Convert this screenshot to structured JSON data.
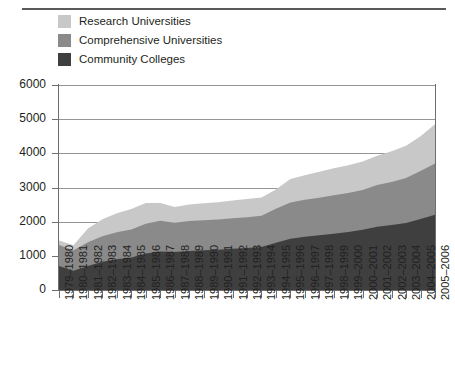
{
  "legend": {
    "items": [
      {
        "label": "Research Universities",
        "color": "#c8c8c8",
        "icon": "legend-swatch-icon"
      },
      {
        "label": "Comprehensive Universities",
        "color": "#8a8a8a",
        "icon": "legend-swatch-icon"
      },
      {
        "label": "Community Colleges",
        "color": "#3f3f3f",
        "icon": "legend-swatch-icon"
      }
    ]
  },
  "chart_data": {
    "type": "area",
    "stacked": true,
    "title": "",
    "subtitle": "",
    "xlabel": "",
    "ylabel": "",
    "ylim": [
      0,
      6000
    ],
    "ytick_labels": [
      "6000",
      "5000",
      "4000",
      "3000",
      "2000",
      "1000",
      "0"
    ],
    "ytick_values": [
      6000,
      5000,
      4000,
      3000,
      2000,
      1000,
      0
    ],
    "ystep": 1000,
    "grid": true,
    "legend_position": "top-left",
    "categories": [
      "1979–1980",
      "1980–1981",
      "1981–1982",
      "1982–1983",
      "1983–1984",
      "1984–1985",
      "1985–1986",
      "1986–1987",
      "1987–1988",
      "1988–1989",
      "1989–1990",
      "1990–1991",
      "1991–1992",
      "1992–1993",
      "1993–1994",
      "1994–1995",
      "1995–1996",
      "1996–1997",
      "1997–1998",
      "1998–1999",
      "1999–2000",
      "2000–2001",
      "2001–2002",
      "2002–2003",
      "2003–2004",
      "2004–2005",
      "2005–2006"
    ],
    "series": [
      {
        "name": "Community Colleges",
        "color": "#3f3f3f",
        "values": [
          700,
          560,
          700,
          830,
          900,
          950,
          1070,
          1130,
          1110,
          1140,
          1160,
          1180,
          1210,
          1230,
          1260,
          1380,
          1500,
          1560,
          1600,
          1650,
          1700,
          1760,
          1850,
          1900,
          1960,
          2080,
          2200
        ]
      },
      {
        "name": "Comprehensive Universities",
        "color": "#8a8a8a",
        "values": [
          620,
          600,
          700,
          740,
          790,
          820,
          870,
          900,
          860,
          880,
          880,
          880,
          890,
          900,
          910,
          1000,
          1060,
          1080,
          1100,
          1120,
          1140,
          1170,
          1220,
          1260,
          1320,
          1400,
          1500
        ]
      },
      {
        "name": "Research Universities",
        "color": "#c8c8c8",
        "values": [
          130,
          150,
          400,
          500,
          560,
          600,
          610,
          520,
          460,
          480,
          500,
          510,
          520,
          530,
          540,
          560,
          690,
          720,
          760,
          790,
          810,
          830,
          860,
          900,
          940,
          1020,
          1150
        ]
      }
    ],
    "totals": [
      1450,
      1310,
      1800,
      2070,
      2250,
      2370,
      2550,
      2550,
      2430,
      2500,
      2540,
      2570,
      2620,
      2660,
      2710,
      2940,
      3250,
      3360,
      3460,
      3560,
      3650,
      3760,
      3930,
      4060,
      4220,
      4500,
      4850
    ]
  }
}
